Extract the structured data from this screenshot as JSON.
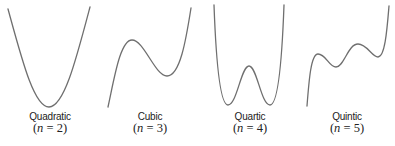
{
  "panels": [
    {
      "name": "Quadratic",
      "formula_var": "n",
      "formula_eq": " = ",
      "formula_val": "2",
      "formula_open": "(",
      "formula_close": ")"
    },
    {
      "name": "Cubic",
      "formula_var": "n",
      "formula_eq": " = ",
      "formula_val": "3",
      "formula_open": "(",
      "formula_close": ")"
    },
    {
      "name": "Quartic",
      "formula_var": "n",
      "formula_eq": " = ",
      "formula_val": "4",
      "formula_open": "(",
      "formula_close": ")"
    },
    {
      "name": "Quintic",
      "formula_var": "n",
      "formula_eq": " = ",
      "formula_val": "5",
      "formula_open": "(",
      "formula_close": ")"
    }
  ],
  "colors": {
    "curve": "#6f6f6f",
    "text": "#222222",
    "background": "#ffffff"
  }
}
